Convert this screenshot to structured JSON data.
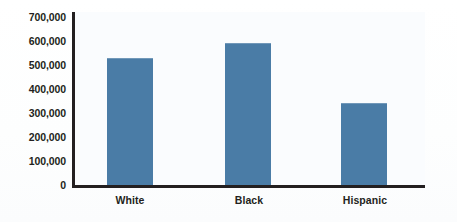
{
  "chart_data": {
    "type": "bar",
    "title": "",
    "subtitle": "",
    "xlabel": "",
    "ylabel": "",
    "categories": [
      "White",
      "Black",
      "Hispanic"
    ],
    "values": [
      515000,
      575000,
      330000
    ],
    "series": [
      {
        "name": "",
        "values": [
          515000,
          575000,
          330000
        ],
        "color": "#4a7ca6"
      }
    ],
    "ylim": [
      0,
      700000
    ],
    "ytick_values": [
      700000,
      600000,
      500000,
      400000,
      300000,
      200000,
      100000,
      0
    ],
    "ytick_labels": [
      "700,000",
      "600,000",
      "500,000",
      "400,000",
      "300,000",
      "200,000",
      "100,000",
      "0"
    ],
    "grid": false,
    "legend": null,
    "legend_position": "none",
    "annotations": [],
    "bar_color": "#4a7ca6",
    "axis_color": "#231f20",
    "plot_background": "#fafcfe",
    "page_background": "#ffffff"
  }
}
